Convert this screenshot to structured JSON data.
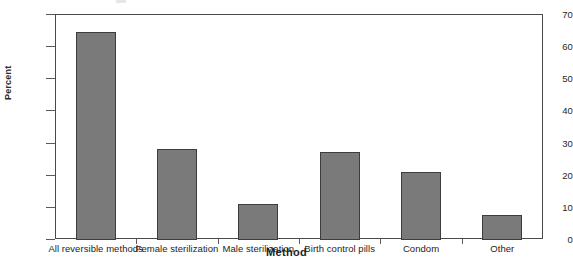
{
  "chart_data": {
    "type": "bar",
    "title": "",
    "subtitle": "",
    "xlabel": "Method",
    "ylabel": "Percent",
    "categories": [
      "All reversible methods",
      "Female sterilization",
      "Male sterilization",
      "Birth control pills",
      "Condom",
      "Other"
    ],
    "values": [
      64.5,
      28.0,
      11.0,
      27.0,
      20.8,
      7.5
    ],
    "ylim": [
      0,
      70
    ],
    "yticks": [
      0,
      10,
      20,
      30,
      40,
      50,
      60,
      70
    ],
    "ytick_labels": [
      "0",
      "10",
      "20",
      "30",
      "40",
      "50",
      "60",
      "70"
    ],
    "grid": false,
    "legend": null,
    "series": [
      {
        "name": "Percent",
        "values": [
          64.5,
          28.0,
          11.0,
          27.0,
          20.8,
          7.5
        ]
      }
    ],
    "colors": {
      "bar_fill": "#7a7a7a",
      "bar_edge": "#3d3d3d",
      "axis": "#4a4a4a",
      "text": "#232323",
      "background": "#ffffff"
    }
  }
}
